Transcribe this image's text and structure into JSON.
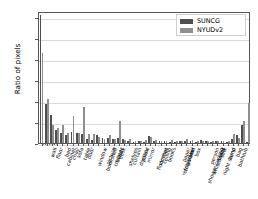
{
  "chart_data": {
    "type": "bar",
    "title": "",
    "xlabel": "",
    "ylabel": "Ratio of pixels",
    "ylim": [
      0.0,
      0.315
    ],
    "yticks": [
      "0.00",
      "0.05",
      "0.10",
      "0.15",
      "0.20",
      "0.25",
      "0.30"
    ],
    "ytick_values": [
      0.0,
      0.05,
      0.1,
      0.15,
      0.2,
      0.25,
      0.3
    ],
    "grid": true,
    "legend_position": "upper right",
    "categories": [
      "wall",
      "floor",
      "cabinet",
      "bed",
      "chair",
      "sofa",
      "table",
      "door",
      "window",
      "bookshelf",
      "picture",
      "counter",
      "blinds",
      "desk",
      "shelves",
      "curtain",
      "dresser",
      "pillow",
      "mirror",
      "floor mat",
      "clothes",
      "ceiling",
      "books",
      "refrigerator",
      "television",
      "paper",
      "towel",
      "shower curtain",
      "box",
      "whiteboard",
      "person",
      "night stand",
      "toilet",
      "sink",
      "lamp",
      "bathtub",
      "bag",
      "otherstructure",
      "otherfurniture",
      "otherprop",
      "background"
    ],
    "series": [
      {
        "name": "SUNCG",
        "color": "#4f4f4f",
        "values": [
          0.305,
          0.093,
          0.066,
          0.03,
          0.023,
          0.019,
          0.026,
          0.023,
          0.022,
          0.01,
          0.007,
          0.019,
          0.012,
          0.013,
          0.01,
          0.013,
          0.009,
          0.005,
          0.003,
          0.005,
          0.002,
          0.016,
          0.004,
          0.006,
          0.005,
          0.002,
          0.003,
          0.004,
          0.004,
          0.004,
          0.001,
          0.007,
          0.005,
          0.003,
          0.005,
          0.006,
          0.002,
          0.01,
          0.018,
          0.042,
          0.003
        ]
      },
      {
        "name": "NYUDv2",
        "color": "#8f8f8f",
        "values": [
          0.215,
          0.106,
          0.042,
          0.036,
          0.043,
          0.023,
          0.064,
          0.023,
          0.086,
          0.022,
          0.022,
          0.014,
          0.009,
          0.019,
          0.009,
          0.052,
          0.007,
          0.01,
          0.006,
          0.005,
          0.007,
          0.014,
          0.007,
          0.006,
          0.004,
          0.007,
          0.005,
          0.004,
          0.01,
          0.007,
          0.005,
          0.004,
          0.005,
          0.004,
          0.005,
          0.004,
          0.004,
          0.022,
          0.013,
          0.052,
          0.096
        ]
      }
    ]
  },
  "legend": {
    "items": [
      {
        "label": "SUNCG"
      },
      {
        "label": "NYUDv2"
      }
    ]
  }
}
